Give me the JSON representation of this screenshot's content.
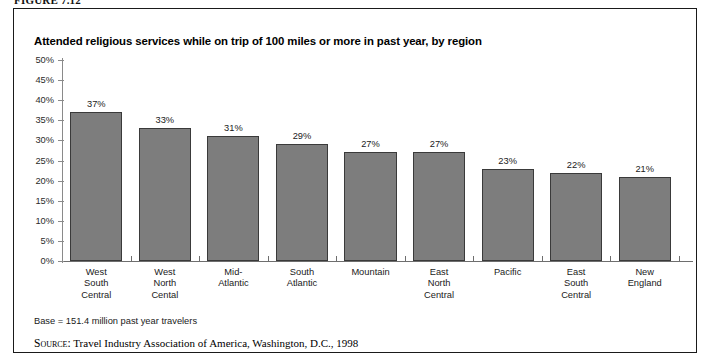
{
  "figure": {
    "caption": "FIGURE 7.12",
    "base_note": "Base = 151.4 million past year travelers",
    "source_label": "Source:",
    "source_text": "Travel Industry Association of America, Washington, D.C., 1998"
  },
  "chart_data": {
    "type": "bar",
    "title": "Attended religious services while on trip of 100 miles or more in past year, by region",
    "xlabel": "",
    "ylabel": "",
    "ylim": [
      0,
      50
    ],
    "ytick_labels": [
      "50%",
      "45%",
      "40%",
      "35%",
      "30%",
      "25%",
      "20%",
      "15%",
      "10%",
      "5%",
      "0%"
    ],
    "ytick_values": [
      50,
      45,
      40,
      35,
      30,
      25,
      20,
      15,
      10,
      5,
      0
    ],
    "grid": false,
    "legend": "none",
    "categories": [
      "West South Central",
      "West North Cental",
      "Mid-Atlantic",
      "South Atlantic",
      "Mountain",
      "East North Central",
      "Pacific",
      "East South Central",
      "New England"
    ],
    "category_lines": [
      [
        "West",
        "South",
        "Central"
      ],
      [
        "West",
        "North",
        "Cental"
      ],
      [
        "Mid-",
        "Atlantic"
      ],
      [
        "South",
        "Atlantic"
      ],
      [
        "Mountain"
      ],
      [
        "East",
        "North",
        "Central"
      ],
      [
        "Pacific"
      ],
      [
        "East",
        "South",
        "Central"
      ],
      [
        "New",
        "England"
      ]
    ],
    "values": [
      37,
      33,
      31,
      29,
      27,
      27,
      23,
      22,
      21
    ],
    "value_labels": [
      "37%",
      "33%",
      "31%",
      "29%",
      "27%",
      "27%",
      "23%",
      "22%",
      "21%"
    ],
    "colors": {
      "bar_fill": "#7d7d7d",
      "bar_border": "#3a3a3a",
      "axis": "#6e6e6e",
      "text": "#1a1a1a",
      "background": "#ffffff"
    }
  }
}
